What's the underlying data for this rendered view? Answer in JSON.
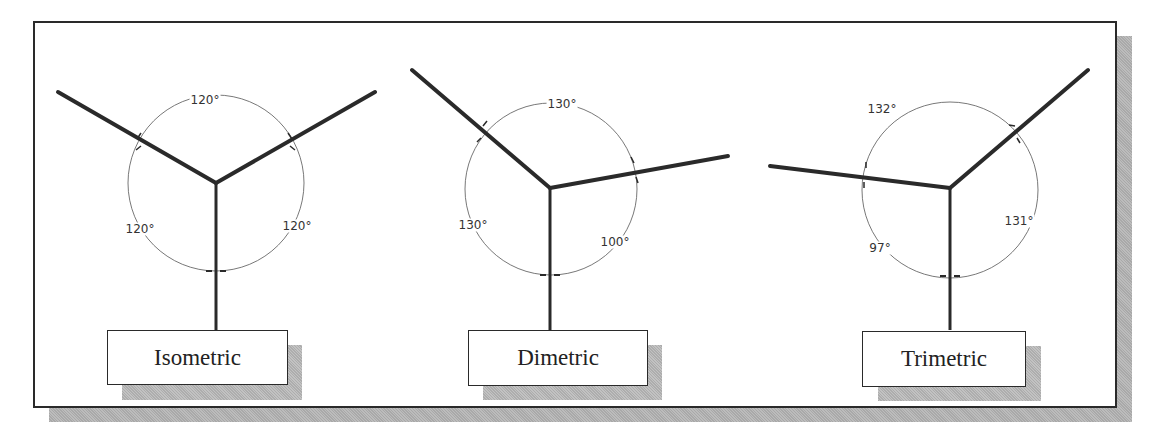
{
  "figure": {
    "panels": [
      {
        "id": "isometric",
        "label": "Isometric",
        "angles": {
          "top": "120°",
          "left": "120°",
          "right": "120°"
        },
        "angle_values": [
          120,
          120,
          120
        ]
      },
      {
        "id": "dimetric",
        "label": "Dimetric",
        "angles": {
          "top": "130°",
          "left": "130°",
          "right": "100°"
        },
        "angle_values": [
          130,
          130,
          100
        ]
      },
      {
        "id": "trimetric",
        "label": "Trimetric",
        "angles": {
          "top": "132°",
          "left": "97°",
          "right": "131°"
        },
        "angle_values": [
          132,
          97,
          131
        ]
      }
    ]
  },
  "colors": {
    "line": "#2a2a2a",
    "dimension": "#555555",
    "shadow": "#b0b0b0",
    "background": "#ffffff"
  }
}
